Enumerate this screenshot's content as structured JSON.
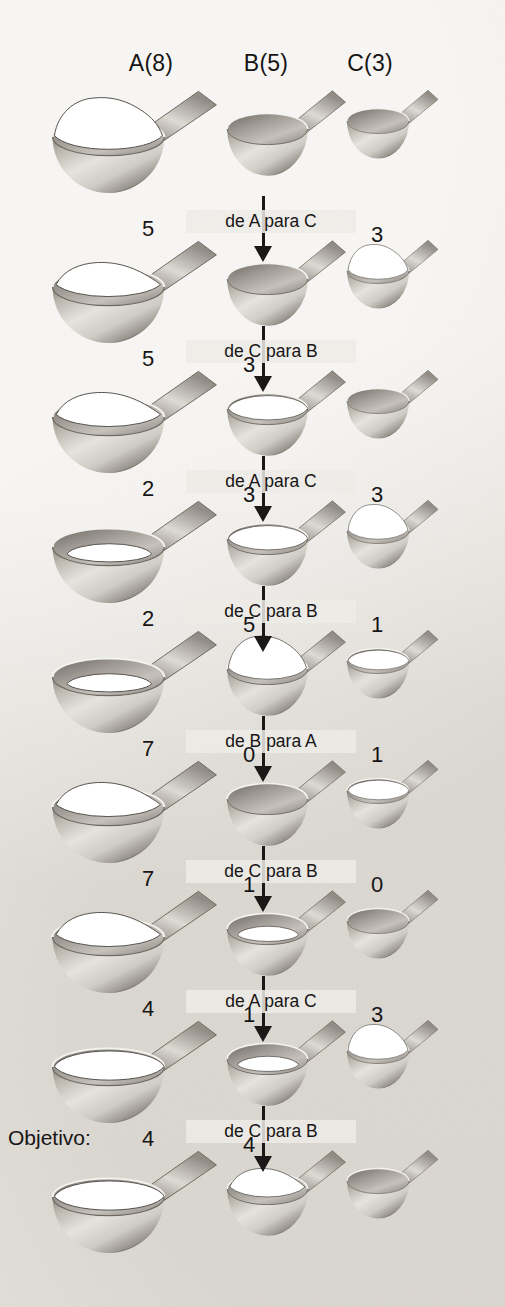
{
  "figure": {
    "goal_label": "Objetivo:",
    "colors": {
      "paper": "#eeebe6",
      "ink": "#1b1918",
      "metal_light": "#f2f0ec",
      "metal_dark": "#6f6b64",
      "contents": "#ffffff"
    }
  },
  "columns": [
    {
      "id": "A",
      "header": "A(8)",
      "capacity": 8
    },
    {
      "id": "B",
      "header": "B(5)",
      "capacity": 5
    },
    {
      "id": "C",
      "header": "C(3)",
      "capacity": 3
    }
  ],
  "states": [
    {
      "index": 0,
      "labels": {
        "A": "",
        "B": "",
        "C": ""
      },
      "amounts": {
        "A": 8,
        "B": 0,
        "C": 0
      },
      "goal": false
    },
    {
      "index": 1,
      "labels": {
        "A": "5",
        "B": "",
        "C": "3"
      },
      "amounts": {
        "A": 5,
        "B": 0,
        "C": 3
      },
      "goal": false
    },
    {
      "index": 2,
      "labels": {
        "A": "5",
        "B": "3",
        "C": ""
      },
      "amounts": {
        "A": 5,
        "B": 3,
        "C": 0
      },
      "goal": false
    },
    {
      "index": 3,
      "labels": {
        "A": "2",
        "B": "3",
        "C": "3"
      },
      "amounts": {
        "A": 2,
        "B": 3,
        "C": 3
      },
      "goal": false
    },
    {
      "index": 4,
      "labels": {
        "A": "2",
        "B": "5",
        "C": "1"
      },
      "amounts": {
        "A": 2,
        "B": 5,
        "C": 1
      },
      "goal": false
    },
    {
      "index": 5,
      "labels": {
        "A": "7",
        "B": "0",
        "C": "1"
      },
      "amounts": {
        "A": 7,
        "B": 0,
        "C": 1
      },
      "goal": false
    },
    {
      "index": 6,
      "labels": {
        "A": "7",
        "B": "1",
        "C": "0"
      },
      "amounts": {
        "A": 7,
        "B": 1,
        "C": 0
      },
      "goal": false
    },
    {
      "index": 7,
      "labels": {
        "A": "4",
        "B": "1",
        "C": "3"
      },
      "amounts": {
        "A": 4,
        "B": 1,
        "C": 3
      },
      "goal": false
    },
    {
      "index": 8,
      "labels": {
        "A": "4",
        "B": "4",
        "C": ""
      },
      "amounts": {
        "A": 4,
        "B": 4,
        "C": 0
      },
      "goal": true
    }
  ],
  "transitions": [
    {
      "index": 0,
      "label": "de A para C",
      "from": "A",
      "to": "C"
    },
    {
      "index": 1,
      "label": "de C para B",
      "from": "C",
      "to": "B"
    },
    {
      "index": 2,
      "label": "de A para C",
      "from": "A",
      "to": "C"
    },
    {
      "index": 3,
      "label": "de C para B",
      "from": "C",
      "to": "B"
    },
    {
      "index": 4,
      "label": "de B para A",
      "from": "B",
      "to": "A"
    },
    {
      "index": 5,
      "label": "de C para B",
      "from": "C",
      "to": "B"
    },
    {
      "index": 6,
      "label": "de A para C",
      "from": "A",
      "to": "C"
    },
    {
      "index": 7,
      "label": "de C para B",
      "from": "C",
      "to": "B"
    }
  ]
}
